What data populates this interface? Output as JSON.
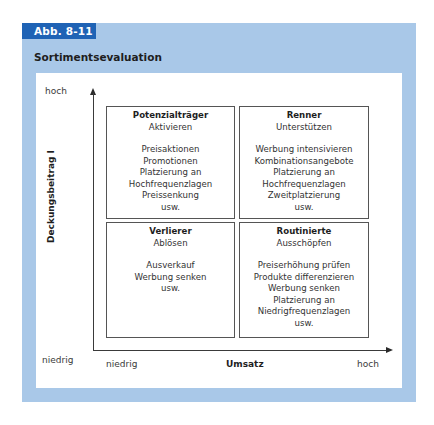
{
  "figure": {
    "tab_label": "Abb. 8-11",
    "title": "Sortimentsevaluation",
    "colors": {
      "tab": "#1f63b5",
      "frame": "#a9c8e8",
      "panel": "#ffffff"
    }
  },
  "axes": {
    "y": {
      "title": "Deckungsbeitrag I",
      "high": "hoch",
      "low": "niedrig"
    },
    "x": {
      "title": "Umsatz",
      "low": "niedrig",
      "high": "hoch"
    }
  },
  "quadrants": {
    "top_left": {
      "name": "Potenzialträger",
      "strategy": "Aktivieren",
      "items": [
        "Preisaktionen",
        "Promotionen",
        "Platzierung an",
        "Hochfrequenzlagen",
        "Preissenkung",
        "usw."
      ]
    },
    "top_right": {
      "name": "Renner",
      "strategy": "Unterstützen",
      "items": [
        "Werbung intensivieren",
        "Kombinationsangebote",
        "Platzierung an",
        "Hochfrequenzlagen",
        "Zweitplatzierung",
        "usw."
      ]
    },
    "bottom_left": {
      "name": "Verlierer",
      "strategy": "Ablösen",
      "items": [
        "Ausverkauf",
        "Werbung senken",
        "usw."
      ]
    },
    "bottom_right": {
      "name": "Routinierte",
      "strategy": "Ausschöpfen",
      "items": [
        "Preiserhöhung prüfen",
        "Produkte differenzieren",
        "Werbung senken",
        "Platzierung an",
        "Niedrigfrequenzlagen",
        "usw."
      ]
    }
  }
}
